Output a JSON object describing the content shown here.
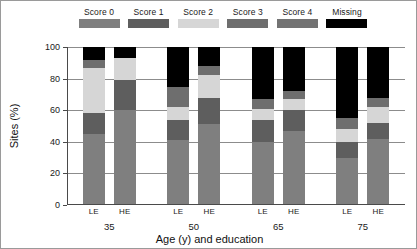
{
  "legend": {
    "items": [
      {
        "label": "Score 0",
        "color": "#7f7f7f",
        "icon": "legend-swatch-score-0"
      },
      {
        "label": "Score 1",
        "color": "#5e5e5e",
        "icon": "legend-swatch-score-1"
      },
      {
        "label": "Score 2",
        "color": "#d6d6d6",
        "icon": "legend-swatch-score-2"
      },
      {
        "label": "Score 3",
        "color": "#6e6e6e",
        "icon": "legend-swatch-score-3"
      },
      {
        "label": "Score 4",
        "color": "#737373",
        "icon": "legend-swatch-score-4"
      },
      {
        "label": "Missing",
        "color": "#000000",
        "icon": "legend-swatch-missing"
      }
    ]
  },
  "axes": {
    "y_title": "Sites (%)",
    "x_title": "Age (y) and education",
    "y_ticks": [
      "0",
      "20",
      "40",
      "60",
      "80",
      "100"
    ]
  },
  "chart_data": {
    "type": "bar",
    "title": "",
    "subtitle": "",
    "stacked": true,
    "orientation": "vertical",
    "xlabel": "Age (y) and education",
    "ylabel": "Sites (%)",
    "ylim": [
      0,
      100
    ],
    "yticks": [
      0,
      20,
      40,
      60,
      80,
      100
    ],
    "grid": true,
    "legend_position": "top",
    "group_labels": [
      "35",
      "50",
      "65",
      "75"
    ],
    "subgroup_labels": [
      "LE",
      "HE"
    ],
    "categories": [
      "35 LE",
      "35 HE",
      "50 LE",
      "50 HE",
      "65 LE",
      "65 HE",
      "75 LE",
      "75 HE"
    ],
    "series": [
      {
        "name": "Score 0",
        "color": "#7f7f7f",
        "values": [
          45,
          60,
          41,
          51,
          40,
          47,
          30,
          42
        ]
      },
      {
        "name": "Score 1",
        "color": "#5e5e5e",
        "values": [
          13,
          19,
          13,
          17,
          14,
          13,
          10,
          10
        ]
      },
      {
        "name": "Score 2",
        "color": "#d6d6d6",
        "values": [
          29,
          14,
          8,
          14,
          7,
          7,
          8,
          10
        ]
      },
      {
        "name": "Score 3",
        "color": "#6e6e6e",
        "values": [
          5,
          0,
          13,
          6,
          6,
          5,
          7,
          6
        ]
      },
      {
        "name": "Score 4",
        "color": "#737373",
        "values": [
          0,
          0,
          0,
          0,
          0,
          0,
          0,
          0
        ]
      },
      {
        "name": "Missing",
        "color": "#000000",
        "values": [
          8,
          7,
          25,
          12,
          33,
          28,
          45,
          32
        ]
      }
    ]
  }
}
